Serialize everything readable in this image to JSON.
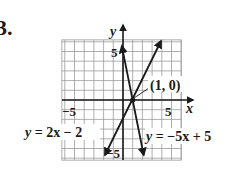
{
  "problem_number": "3.",
  "chart_data": {
    "type": "line",
    "title": "",
    "xlabel": "x",
    "ylabel": "y",
    "xlim": [
      -6.3,
      6
    ],
    "ylim": [
      -6.2,
      6.2
    ],
    "grid": true,
    "tick_labels": {
      "x": [
        {
          "value": -5,
          "label": "−5"
        },
        {
          "value": 5,
          "label": "5"
        }
      ],
      "y": [
        {
          "value": 5,
          "label": "5"
        },
        {
          "value": -5,
          "label": "−5"
        }
      ]
    },
    "series": [
      {
        "name": "y = 2x − 2",
        "slope": 2,
        "intercept": -2,
        "x": [
          -1.85,
          4.0
        ],
        "y": [
          -5.7,
          6.0
        ],
        "arrows": "both"
      },
      {
        "name": "y = −5x + 5",
        "slope": -5,
        "intercept": 5,
        "x": [
          -0.12,
          2.14
        ],
        "y": [
          5.6,
          -5.7
        ],
        "arrows": "both"
      }
    ],
    "annotations": [
      {
        "text": "(1, 0)",
        "x": 1,
        "y": 0,
        "type": "intersection-point"
      }
    ]
  },
  "labels": {
    "x_axis": "x",
    "y_axis": "y",
    "x_neg5": "−5",
    "x_pos5": "5",
    "y_pos5": "5",
    "y_neg5": "−5",
    "point": "(1, 0)",
    "eq_left_lhs": "y",
    "eq_left_rhs": " = 2x − 2",
    "eq_right_lhs": "y",
    "eq_right_rhs": " = −5x + 5"
  },
  "style": {
    "grid_color": "#9a9a9a",
    "axis_color": "#1a1a1a",
    "line_color": "#1a1a1a"
  }
}
